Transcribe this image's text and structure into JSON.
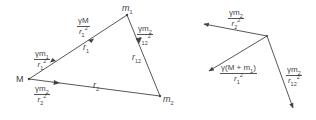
{
  "diagram": {
    "title": "",
    "colors": {
      "line": "#444444",
      "text": "#444444",
      "background": "#ffffff"
    },
    "left": {
      "points": {
        "M": {
          "label": "M",
          "x": 29,
          "y": 79
        },
        "m1": {
          "label": "m",
          "sub": "1",
          "x": 127,
          "y": 15
        },
        "m2": {
          "label": "m",
          "sub": "2",
          "x": 160,
          "y": 96
        }
      },
      "distances": {
        "r1": {
          "label": "r",
          "sub": "1"
        },
        "r2": {
          "label": "r",
          "sub": "2"
        },
        "r12": {
          "label": "r",
          "sub": "12"
        }
      },
      "forces": [
        {
          "id": "gm1_r1sq",
          "num": "γm",
          "num_sub": "1",
          "den": "r",
          "den_sub": "1",
          "den_sup": "2",
          "on": "M",
          "toward": "m1"
        },
        {
          "id": "gM_r1sq",
          "num": "γM",
          "den": "r",
          "den_sub": "1",
          "den_sup": "2",
          "on": "m1",
          "toward": "M"
        },
        {
          "id": "gm2_r12sq",
          "num": "γm",
          "num_sub": "2",
          "den": "r",
          "den_sub": "12",
          "den_sup": "2",
          "on": "m1",
          "toward": "m2"
        },
        {
          "id": "gm2_r2sq",
          "num": "γm",
          "num_sub": "2",
          "den": "r",
          "den_sub": "2",
          "den_sup": "2",
          "on": "M",
          "toward": "m2"
        }
      ]
    },
    "right": {
      "forces": [
        {
          "id": "gm2_r2sq",
          "num": "γm",
          "num_sub": "2",
          "den": "r",
          "den_sub": "2",
          "den_sup": "2"
        },
        {
          "id": "gMm1_r1sq",
          "num_pre": "γ(M + m",
          "num_sub": "1",
          "num_post": ")",
          "den": "r",
          "den_sub": "1",
          "den_sup": "2"
        },
        {
          "id": "gm2_r12sq",
          "num": "γm",
          "num_sub": "2",
          "den": "r",
          "den_sub": "12",
          "den_sup": "2"
        }
      ]
    }
  }
}
